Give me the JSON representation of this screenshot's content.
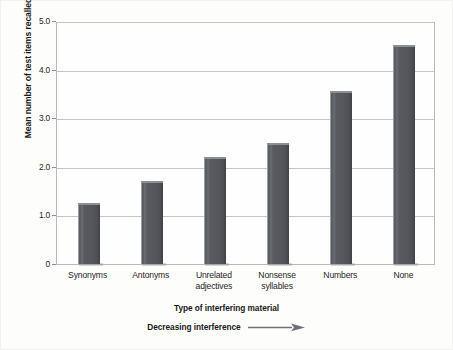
{
  "chart_data": {
    "type": "bar",
    "title": "",
    "xlabel": "Type of interfering material",
    "ylabel": "Mean number of test items recalled",
    "categories": [
      "Synonyms",
      "Antonyms",
      "Unrelated adjectives",
      "Nonsense syllables",
      "Numbers",
      "None"
    ],
    "category_lines": [
      [
        "Synonyms"
      ],
      [
        "Antonyms"
      ],
      [
        "Unrelated",
        "adjectives"
      ],
      [
        "Nonsense",
        "syllables"
      ],
      [
        "Numbers"
      ],
      [
        "None"
      ]
    ],
    "values": [
      1.25,
      1.7,
      2.2,
      2.48,
      3.55,
      4.5
    ],
    "ylim": [
      0,
      5.0
    ],
    "yticks": [
      0,
      1.0,
      2.0,
      3.0,
      4.0,
      5.0
    ],
    "ytick_labels": [
      "0",
      "1.0",
      "2.0",
      "3.0",
      "4.0",
      "5.0"
    ],
    "grid": "horizontal",
    "legend": "none",
    "bar_color": "#55575d",
    "bar_highlight_color": "#8c8f95",
    "gridline_color": "#c4c4c2",
    "frame_color": "#b9b9b7",
    "annotation": "Decreasing interference",
    "annotation_icon": "right-arrow-icon"
  },
  "ylabel_text": "Mean number of test items recalled",
  "xlabel_text": "Type of interfering material",
  "annotation_text": "Decreasing interference"
}
